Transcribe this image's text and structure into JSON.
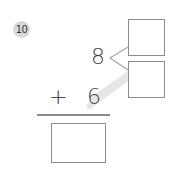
{
  "problem": {
    "number": "10",
    "addend_top": "8",
    "operator": "+",
    "addend_bottom": "6",
    "decompose_boxes": [
      "",
      ""
    ],
    "answer_box": ""
  },
  "colors": {
    "badge_bg": "#d9d9d9",
    "box_border": "#8c8c8c",
    "highlight": "#e6e6e6",
    "text": "#444444"
  }
}
